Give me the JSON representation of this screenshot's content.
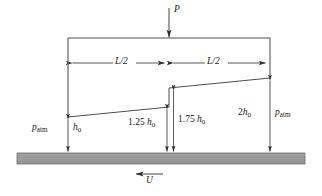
{
  "figure": {
    "type": "engineering-diagram",
    "colors": {
      "line": "#3a3a3a",
      "wall_fill": "#9a9a9a",
      "wall_stroke": "#6e6e6e",
      "background": "#ffffff",
      "text": "#1a1a1a"
    },
    "labels": {
      "load": "P",
      "length_left": "L/2",
      "length_right": "L/2",
      "gap_inlet_num": "",
      "gap_inlet_sym": "h",
      "gap_inlet_sub": "0",
      "gap_step_left_num": "1.25 ",
      "gap_step_left_sym": "h",
      "gap_step_left_sub": "0",
      "gap_step_right_num": "1.75 ",
      "gap_step_right_sym": "h",
      "gap_step_right_sub": "0",
      "gap_outlet_num": "2",
      "gap_outlet_sym": "h",
      "gap_outlet_sub": "0",
      "pressure_left_sym": "p",
      "pressure_left_sub": "atm",
      "pressure_right_sym": "p",
      "pressure_right_sub": "atm",
      "wall_velocity": "U"
    },
    "geometry": {
      "pad_top_y": 38,
      "pad_left_x": 68,
      "pad_right_x": 270,
      "step_x": 169,
      "wall_top_y": 153,
      "wall_bottom_y": 164,
      "wall_left_x": 17,
      "wall_right_x": 305,
      "inlet_gap_y": 117,
      "step_left_gap_y": 107,
      "step_right_gap_y": 88,
      "outlet_gap_y": 78,
      "dimension_row_y": 63
    },
    "values": {
      "inlet_gap": "h0",
      "step_left_gap": "1.25 h0",
      "step_right_gap": "1.75 h0",
      "outlet_gap": "2 h0",
      "pad_length_each_half": "L/2"
    }
  }
}
